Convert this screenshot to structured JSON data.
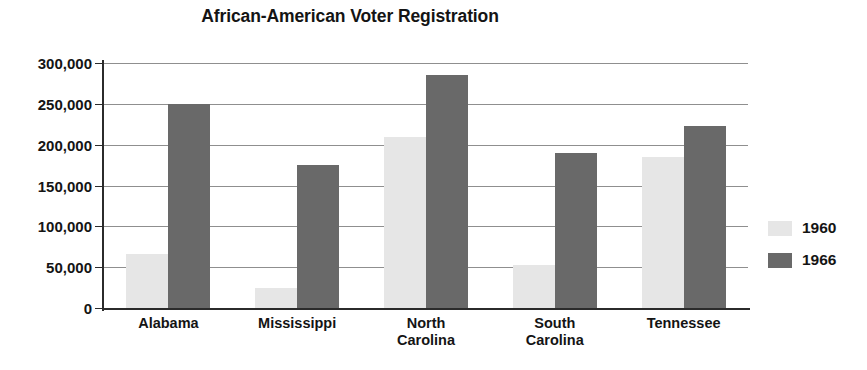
{
  "chart_data": {
    "type": "bar",
    "title": "African-American Voter Registration",
    "xlabel": "",
    "ylabel": "",
    "categories": [
      "Alabama",
      "Mississippi",
      "North Carolina",
      "South Carolina",
      "Tennessee"
    ],
    "series": [
      {
        "name": "1960",
        "values": [
          66000,
          25000,
          210000,
          53000,
          185000
        ],
        "color": "#e6e6e6"
      },
      {
        "name": "1966",
        "values": [
          250000,
          175000,
          285000,
          190000,
          223000
        ],
        "color": "#696969"
      }
    ],
    "ylim": [
      0,
      300000
    ],
    "ytick_values": [
      0,
      50000,
      100000,
      150000,
      200000,
      250000,
      300000
    ],
    "ytick_labels": [
      "0",
      "50,000",
      "100,000",
      "150,000",
      "200,000",
      "250,000",
      "300,000"
    ],
    "grid": true,
    "legend_position": "right",
    "legend": [
      "1960",
      "1966"
    ]
  }
}
